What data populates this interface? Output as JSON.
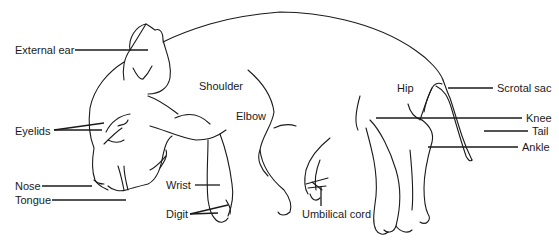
{
  "diagram": {
    "labels": {
      "external_ear": "External ear",
      "eyelids": "Eyelids",
      "nose": "Nose",
      "tongue": "Tongue",
      "shoulder": "Shoulder",
      "elbow": "Elbow",
      "wrist": "Wrist",
      "digit": "Digit",
      "umbilical_cord": "Umbilical cord",
      "hip": "Hip",
      "scrotal_sac": "Scrotal sac",
      "knee": "Knee",
      "tail": "Tail",
      "ankle": "Ankle"
    },
    "colors": {
      "line": "#1a1a1a",
      "background": "#ffffff"
    }
  }
}
